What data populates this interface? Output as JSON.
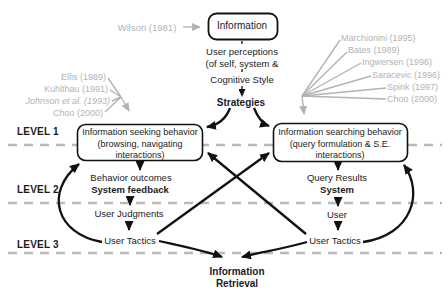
{
  "top": {
    "wilson": "Wilson (1981)",
    "information_box": "Information",
    "user_perceptions_1": "User perceptions",
    "user_perceptions_2": "(of self, system &",
    "cognitive_style": "Cognitive Style",
    "strategies": "Strategies"
  },
  "citations_left": [
    "Ellis (1989)",
    "Kuhlthau (1991)",
    "Johnson et al. (1993)",
    "Choo (2000)"
  ],
  "citations_right": [
    "Marchionini (1995)",
    "Bates (1989)",
    "Ingwersen (1996)",
    "Saracevic (1996)",
    "Spink (1997)",
    "Choo (2000)"
  ],
  "levels": {
    "l1": "LEVEL 1",
    "l2": "LEVEL 2",
    "l3": "LEVEL 3"
  },
  "seeking": {
    "l1": "Information seeking behavior",
    "l2": "(browsing, navigating",
    "l3": "interactions)"
  },
  "searching": {
    "l1": "Information searching behavior",
    "l2": "(query formulation & S.E.",
    "l3": "interactions)"
  },
  "left_flow": {
    "behavior_outcomes": "Behavior outcomes",
    "system_feedback": "System feedback",
    "user_judgments": "User Judgments",
    "user_tactics": "User Tactics"
  },
  "right_flow": {
    "query_results": "Query Results",
    "system": "System",
    "user": "User",
    "user_tactics": "User Tactics"
  },
  "bottom": {
    "l1": "Information",
    "l2": "Retrieval"
  },
  "colors": {
    "text": "#1b1b1b",
    "citation_gray": "#b3b3b3",
    "dash_gray": "#b9b9b9",
    "box_border": "#111111",
    "background": "#ffffff"
  }
}
